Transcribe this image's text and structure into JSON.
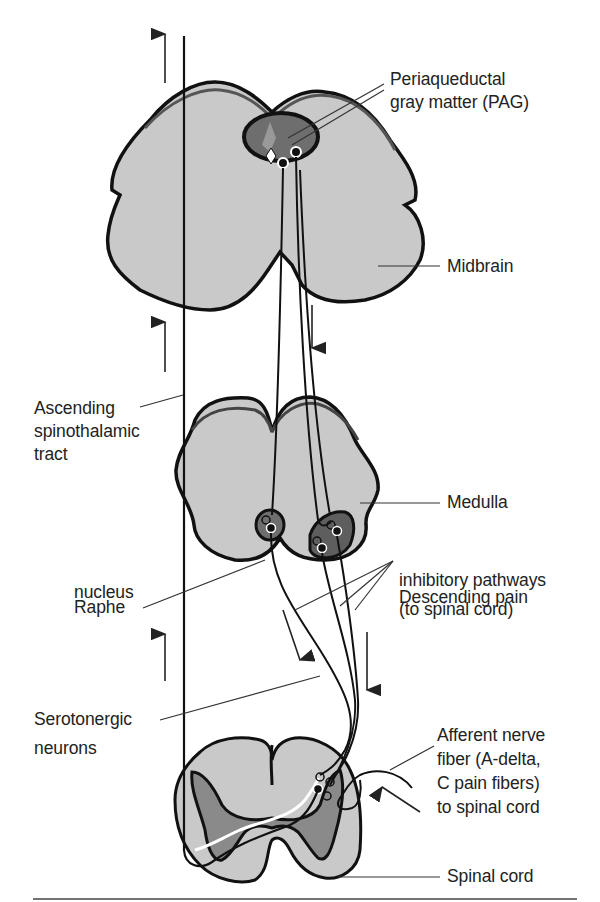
{
  "diagram": {
    "colors": {
      "tissue": "#c9c9c9",
      "gray_matter": "#8a8a8a",
      "nucleus": "#6e6e6e",
      "outline": "#111111",
      "text": "#222222",
      "leader": "#333333"
    },
    "structures": [
      "Midbrain",
      "Medulla",
      "Spinal cord"
    ],
    "labels": {
      "pag_line1": "Periaqueductal",
      "pag_line2": "gray matter (PAG)",
      "midbrain": "Midbrain",
      "ascending_line1": "Ascending",
      "ascending_line2": "spinothalamic",
      "ascending_line3": "tract",
      "medulla": "Medulla",
      "raphe_line1": "Raphe",
      "raphe_line2": "nucleus",
      "descending_line1": "Descending pain",
      "descending_line2": "inhibitory pathways",
      "descending_line3": "(to spinal cord)",
      "serotonergic_line1": "Serotonergic",
      "serotonergic_line2": "neurons",
      "afferent_line1": "Afferent nerve",
      "afferent_line2": "fiber (A-delta,",
      "afferent_line3": "C pain fibers)",
      "afferent_line4": "to spinal cord",
      "spinal_cord": "Spinal cord"
    },
    "arrows": {
      "ascending": [
        "up",
        "up",
        "up"
      ],
      "descending": [
        "down",
        "down",
        "down"
      ],
      "afferent": "inward"
    }
  }
}
